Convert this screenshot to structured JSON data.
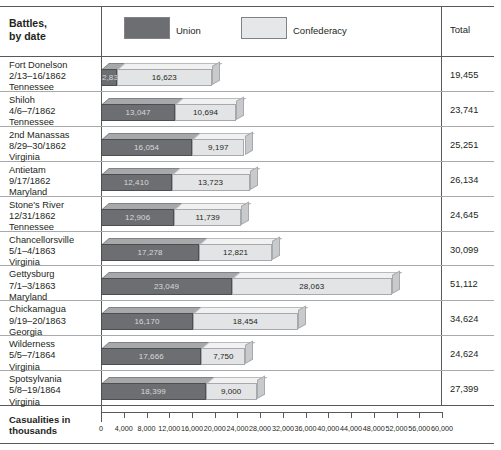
{
  "header": {
    "battles_label": "Battles,\nby date",
    "total_label": "Total"
  },
  "legend": {
    "union": "Union",
    "confederacy": "Confederacy",
    "union_color": "#6d6e71",
    "confederacy_color": "#e3e4e5"
  },
  "axis": {
    "title": "Casualities in\nthousands",
    "ticks": [
      "0",
      "4,000",
      "8,000",
      "12,000",
      "16,000",
      "20,000",
      "24,000",
      "28,000",
      "32,000",
      "36,000",
      "40,000",
      "44,000",
      "48,000",
      "52,000",
      "56,000",
      "60,000"
    ]
  },
  "chart_data": {
    "type": "bar",
    "title": "Battles, by date",
    "xlabel": "Casualities in thousands",
    "ylabel": "Battles, by date",
    "xlim": [
      0,
      60000
    ],
    "grid": false,
    "stacked": true,
    "legend_position": "top",
    "categories": [
      "Fort Donelson 2/13–16/1862 Tennessee",
      "Shiloh 4/6–7/1862 Tennessee",
      "2nd Manassas 8/29–30/1862 Virginia",
      "Antietam 9/17/1862 Maryland",
      "Stone's River 12/31/1862 Tennessee",
      "Chancellorsville 5/1–4/1863 Virginia",
      "Gettysburg 7/1–3/1863 Maryland",
      "Chickamagua 9/19–20/1863 Georgia",
      "Wilderness 5/5–7/1864 Virginia",
      "Spotsylvania 5/8–19/1864 Virginia"
    ],
    "series": [
      {
        "name": "Union",
        "values": [
          2832,
          13047,
          16054,
          12410,
          12906,
          17278,
          23049,
          16170,
          17666,
          18399
        ]
      },
      {
        "name": "Confederacy",
        "values": [
          16623,
          10694,
          9197,
          13723,
          11739,
          12821,
          28063,
          18454,
          7750,
          9000
        ]
      }
    ],
    "totals": [
      19455,
      23741,
      25251,
      26134,
      24645,
      30099,
      51112,
      34624,
      24624,
      27399
    ]
  },
  "rows": [
    {
      "name": "Fort Donelson",
      "date": "2/13–16/1862",
      "place": "Tennessee",
      "union": "2,832",
      "confederacy": "16,623",
      "total": "19,455",
      "union_value": 2832,
      "confederacy_value": 16623
    },
    {
      "name": "Shiloh",
      "date": "4/6–7/1862",
      "place": "Tennessee",
      "union": "13,047",
      "confederacy": "10,694",
      "total": "23,741",
      "union_value": 13047,
      "confederacy_value": 10694
    },
    {
      "name": "2nd Manassas",
      "date": "8/29–30/1862",
      "place": "Virginia",
      "union": "16,054",
      "confederacy": "9,197",
      "total": "25,251",
      "union_value": 16054,
      "confederacy_value": 9197
    },
    {
      "name": "Antietam",
      "date": "9/17/1862",
      "place": "Maryland",
      "union": "12,410",
      "confederacy": "13,723",
      "total": "26,134",
      "union_value": 12410,
      "confederacy_value": 13723
    },
    {
      "name": "Stone's River",
      "date": "12/31/1862",
      "place": "Tennessee",
      "union": "12,906",
      "confederacy": "11,739",
      "total": "24,645",
      "union_value": 12906,
      "confederacy_value": 11739
    },
    {
      "name": "Chancellorsville",
      "date": "5/1–4/1863",
      "place": "Virginia",
      "union": "17,278",
      "confederacy": "12,821",
      "total": "30,099",
      "union_value": 17278,
      "confederacy_value": 12821
    },
    {
      "name": "Gettysburg",
      "date": "7/1–3/1863",
      "place": "Maryland",
      "union": "23,049",
      "confederacy": "28,063",
      "total": "51,112",
      "union_value": 23049,
      "confederacy_value": 28063
    },
    {
      "name": "Chickamagua",
      "date": "9/19–20/1863",
      "place": "Georgia",
      "union": "16,170",
      "confederacy": "18,454",
      "total": "34,624",
      "union_value": 16170,
      "confederacy_value": 18454
    },
    {
      "name": "Wilderness",
      "date": "5/5–7/1864",
      "place": "Virginia",
      "union": "17,666",
      "confederacy": "7,750",
      "total": "24,624",
      "union_value": 17666,
      "confederacy_value": 7750
    },
    {
      "name": "Spotsylvania",
      "date": "5/8–19/1864",
      "place": "Virginia",
      "union": "18,399",
      "confederacy": "9,000",
      "total": "27,399",
      "union_value": 18399,
      "confederacy_value": 9000
    }
  ]
}
